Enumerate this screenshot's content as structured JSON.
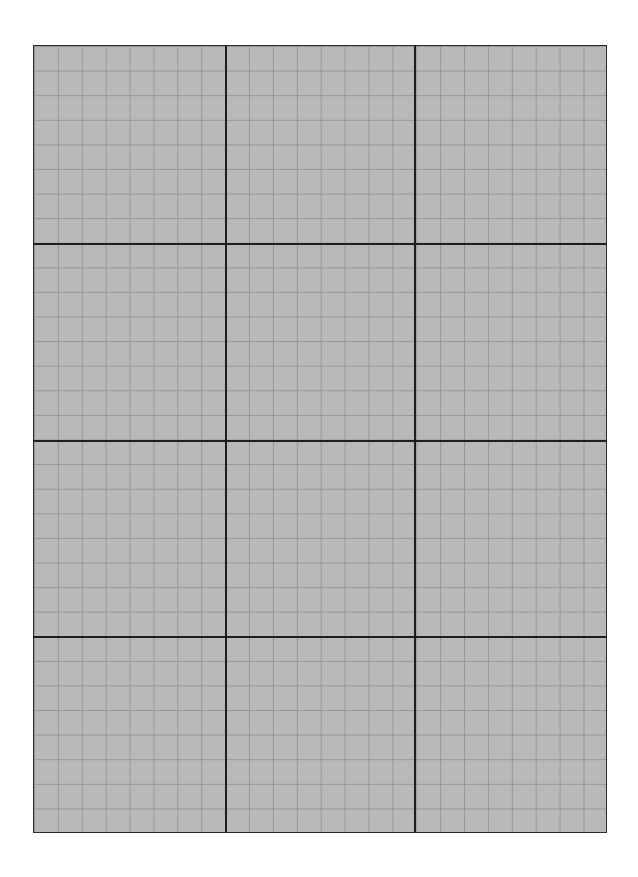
{
  "page": {
    "type": "grid-paper",
    "background_color": "#ffffff"
  },
  "sheet": {
    "fill_color": "#b9b9b9",
    "border_color": "#2a2a2a",
    "minor_line_color": "#8c8c8c",
    "major_line_color": "#1e1e1e",
    "major_columns": 3,
    "major_rows": 4,
    "minor_divisions_per_major": 8,
    "major_vertical_positions_px": [
      191,
      380
    ],
    "major_horizontal_positions_px": [
      198,
      394,
      590
    ]
  }
}
